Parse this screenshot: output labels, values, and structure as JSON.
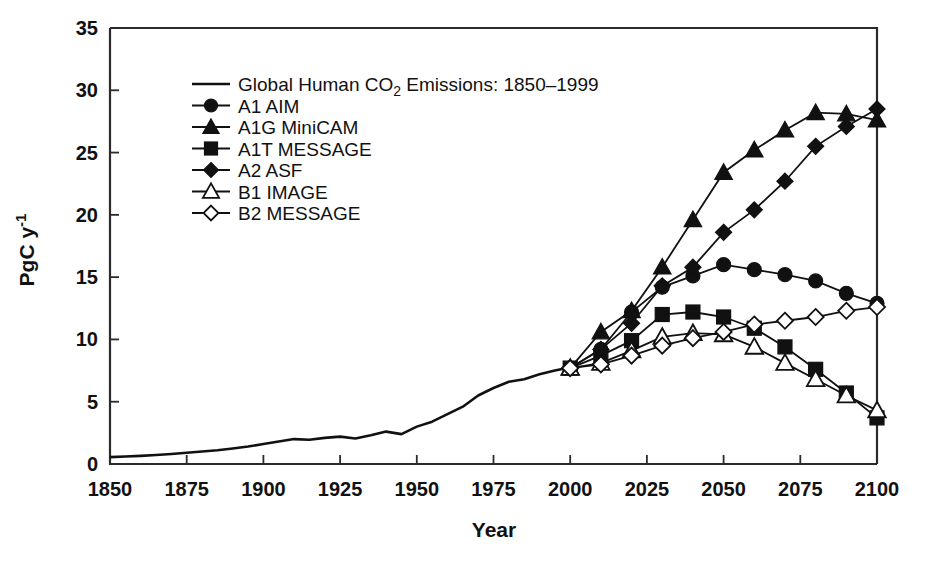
{
  "chart_data": {
    "type": "line",
    "title": "",
    "xlabel": "Year",
    "ylabel": "PgC y-1",
    "ylabel_display": "PgC y",
    "ylabel_sup": "-1",
    "xlim": [
      1850,
      2100
    ],
    "ylim": [
      0,
      35
    ],
    "xticks": [
      1850,
      1875,
      1900,
      1925,
      1950,
      1975,
      2000,
      2025,
      2050,
      2075,
      2100
    ],
    "yticks": [
      0,
      5,
      10,
      15,
      20,
      25,
      30,
      35
    ],
    "grid": false,
    "legend_position": "upper-left-inside",
    "historical": {
      "name": "Global Human CO2 Emissions: 1850-1999",
      "label": "Global Human CO",
      "label_sub": "2",
      "label_tail": " Emissions: 1850–1999",
      "marker": "none",
      "x": [
        1850,
        1855,
        1860,
        1865,
        1870,
        1875,
        1880,
        1885,
        1890,
        1895,
        1900,
        1905,
        1910,
        1915,
        1920,
        1925,
        1930,
        1935,
        1940,
        1945,
        1950,
        1955,
        1960,
        1965,
        1970,
        1975,
        1980,
        1985,
        1990,
        1995,
        1999
      ],
      "y": [
        0.55,
        0.6,
        0.65,
        0.72,
        0.8,
        0.9,
        1.0,
        1.1,
        1.25,
        1.4,
        1.6,
        1.8,
        2.0,
        1.95,
        2.1,
        2.2,
        2.05,
        2.3,
        2.6,
        2.4,
        3.0,
        3.4,
        4.0,
        4.6,
        5.5,
        6.1,
        6.6,
        6.8,
        7.2,
        7.5,
        7.7
      ]
    },
    "series": [
      {
        "name": "A1 AIM",
        "marker": "filled-circle",
        "x": [
          2000,
          2010,
          2020,
          2030,
          2040,
          2050,
          2060,
          2070,
          2080,
          2090,
          2100
        ],
        "y": [
          7.7,
          9.2,
          12.2,
          14.2,
          15.1,
          16.0,
          15.6,
          15.2,
          14.7,
          13.7,
          12.9
        ]
      },
      {
        "name": "A1G MiniCAM",
        "marker": "filled-triangle",
        "x": [
          2000,
          2010,
          2020,
          2030,
          2040,
          2050,
          2060,
          2070,
          2080,
          2090,
          2100
        ],
        "y": [
          7.7,
          10.6,
          12.3,
          15.8,
          19.6,
          23.4,
          25.2,
          26.8,
          28.2,
          28.1,
          27.6
        ]
      },
      {
        "name": "A1T MESSAGE",
        "marker": "filled-square",
        "x": [
          2000,
          2010,
          2020,
          2030,
          2040,
          2050,
          2060,
          2070,
          2080,
          2090,
          2100
        ],
        "y": [
          7.7,
          8.7,
          9.9,
          12.0,
          12.2,
          11.8,
          10.9,
          9.4,
          7.6,
          5.7,
          3.7
        ]
      },
      {
        "name": "A2 ASF",
        "marker": "filled-diamond",
        "x": [
          2000,
          2010,
          2020,
          2030,
          2040,
          2050,
          2060,
          2070,
          2080,
          2090,
          2100
        ],
        "y": [
          7.7,
          9.2,
          11.3,
          14.3,
          15.8,
          18.6,
          20.4,
          22.7,
          25.5,
          27.1,
          28.5
        ]
      },
      {
        "name": "B1 IMAGE",
        "marker": "open-triangle",
        "x": [
          2000,
          2010,
          2020,
          2030,
          2040,
          2050,
          2060,
          2070,
          2080,
          2090,
          2100
        ],
        "y": [
          7.7,
          8.1,
          9.1,
          10.2,
          10.5,
          10.4,
          9.4,
          8.1,
          6.8,
          5.5,
          4.3
        ]
      },
      {
        "name": "B2 MESSAGE",
        "marker": "open-diamond",
        "x": [
          2000,
          2010,
          2020,
          2030,
          2040,
          2050,
          2060,
          2070,
          2080,
          2090,
          2100
        ],
        "y": [
          7.7,
          8.0,
          8.7,
          9.5,
          10.1,
          10.6,
          11.2,
          11.5,
          11.8,
          12.3,
          12.6
        ]
      }
    ]
  },
  "axes": {
    "x_title": "Year",
    "y_title_main": "PgC y",
    "y_title_sup": "-1"
  },
  "colors": {
    "line": "#111111",
    "axis": "#2b2b2b",
    "background": "#ffffff"
  }
}
